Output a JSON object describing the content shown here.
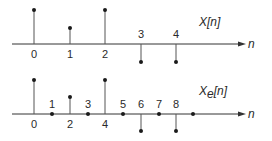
{
  "diagram": {
    "top": {
      "title": "X[n]",
      "title_main": "X",
      "title_sub": "",
      "title_arg": "[n]",
      "axis_label": "n",
      "samples": [
        {
          "n": "0",
          "value": 2,
          "label_pos": "below"
        },
        {
          "n": "1",
          "value": 1,
          "label_pos": "below"
        },
        {
          "n": "2",
          "value": 2,
          "label_pos": "below"
        },
        {
          "n": "3",
          "value": -1,
          "label_pos": "above"
        },
        {
          "n": "4",
          "value": -1,
          "label_pos": "above"
        }
      ]
    },
    "bottom": {
      "title": "Xe[n]",
      "title_main": "X",
      "title_sub": "e",
      "title_arg": "[n]",
      "axis_label": "n",
      "samples": [
        {
          "n": "0",
          "value": 2,
          "label_pos": "below"
        },
        {
          "n": "1",
          "value": 0,
          "label_pos": "above"
        },
        {
          "n": "2",
          "value": 1,
          "label_pos": "below"
        },
        {
          "n": "3",
          "value": 0,
          "label_pos": "above"
        },
        {
          "n": "4",
          "value": 2,
          "label_pos": "below"
        },
        {
          "n": "5",
          "value": 0,
          "label_pos": "above"
        },
        {
          "n": "6",
          "value": -1,
          "label_pos": "above"
        },
        {
          "n": "7",
          "value": 0,
          "label_pos": "above"
        },
        {
          "n": "8",
          "value": -1,
          "label_pos": "above"
        },
        {
          "n": "",
          "value": 0,
          "label_pos": "none"
        }
      ]
    }
  }
}
